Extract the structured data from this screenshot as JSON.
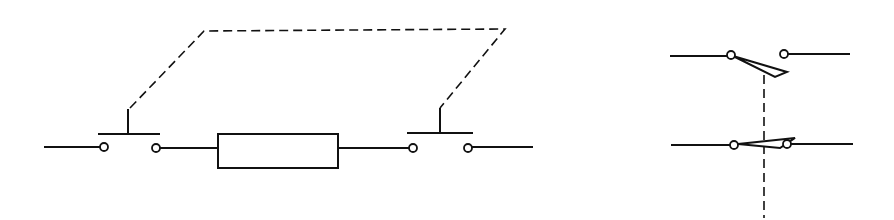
{
  "diagram": {
    "colors": {
      "stroke": "#111111",
      "background": "#ffffff"
    },
    "left_circuit": {
      "description": "Two mechanically linked push-button switches in series with a resistor",
      "components": [
        {
          "type": "push-button-switch",
          "label": ""
        },
        {
          "type": "resistor",
          "label": ""
        },
        {
          "type": "push-button-switch",
          "label": ""
        }
      ],
      "linkage": "dashed mechanical link between push buttons"
    },
    "right_circuit": {
      "description": "Two-pole switch with mechanically linked contacts (one open, one closed)",
      "components": [
        {
          "type": "switch-contact",
          "state": "open"
        },
        {
          "type": "switch-contact",
          "state": "closed"
        }
      ],
      "linkage": "vertical dashed mechanical link"
    }
  }
}
